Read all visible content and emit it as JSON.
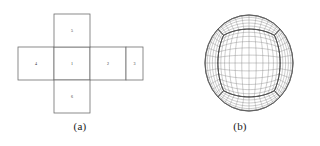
{
  "figure": {
    "background_color": "#ffffff",
    "line_color": "#6e6e6e",
    "edge_color": "#3d3d3d",
    "grid_color": "#8a8a8a",
    "text_color": "#2b2b2b"
  },
  "panel_a": {
    "caption": "(a)",
    "description": "Unfolded cube net with six numbered faces",
    "cells": [
      {
        "label": "4",
        "x": 18,
        "y": 47,
        "w": 36,
        "h": 33,
        "name": "face-4"
      },
      {
        "label": "1",
        "x": 54,
        "y": 47,
        "w": 36,
        "h": 33,
        "name": "face-1"
      },
      {
        "label": "2",
        "x": 90,
        "y": 47,
        "w": 36,
        "h": 33,
        "name": "face-2"
      },
      {
        "label": "3",
        "x": 126,
        "y": 47,
        "w": 17,
        "h": 33,
        "name": "face-3"
      },
      {
        "label": "5",
        "x": 54,
        "y": 14,
        "w": 36,
        "h": 33,
        "name": "face-5"
      },
      {
        "label": "6",
        "x": 54,
        "y": 80,
        "w": 36,
        "h": 33,
        "name": "face-6"
      }
    ]
  },
  "panel_b": {
    "caption": "(b)",
    "description": "Gnomonic cubed-sphere mesh on the sphere",
    "sphere": {
      "cx": 89,
      "cy": 63,
      "rx": 44,
      "ry": 48,
      "divisions": 12,
      "view_yaw_deg": 0,
      "view_pitch_deg": 0
    }
  },
  "chart_data": {
    "type": "diagram",
    "panels": [
      {
        "id": "a",
        "caption": "(a)",
        "kind": "cube-net",
        "face_labels": [
          "1",
          "2",
          "3",
          "4",
          "5",
          "6"
        ],
        "layout": "cross",
        "row_faces": [
          "4",
          "1",
          "2",
          "3"
        ],
        "column_faces": [
          "5",
          "1",
          "6"
        ]
      },
      {
        "id": "b",
        "caption": "(b)",
        "kind": "cubed-sphere-mesh",
        "grid_divisions_per_face": 12,
        "projection": "gnomonic"
      }
    ]
  }
}
